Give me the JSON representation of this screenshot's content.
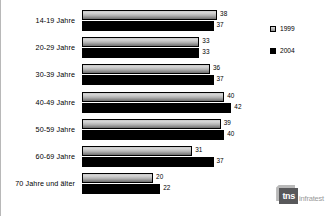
{
  "chart_data": {
    "type": "bar",
    "orientation": "horizontal",
    "title": "",
    "xlabel": "",
    "ylabel": "",
    "grid": false,
    "xlim": [
      0,
      45
    ],
    "legend_position": "right-top",
    "categories": [
      "14-19 Jahre",
      "20-29 Jahre",
      "30-39 Jahre",
      "40-49 Jahre",
      "50-59 Jahre",
      "60-69 Jahre",
      "70 Jahre und älter"
    ],
    "series": [
      {
        "name": "1999",
        "values": [
          38,
          33,
          36,
          40,
          39,
          31,
          20
        ]
      },
      {
        "name": "2004",
        "values": [
          37,
          33,
          37,
          42,
          40,
          37,
          22
        ]
      }
    ]
  },
  "legend": {
    "items": [
      {
        "label": "1999",
        "swatch": "gradient-gray"
      },
      {
        "label": "2004",
        "swatch": "solid-black"
      }
    ]
  },
  "logo": {
    "mark": "tns",
    "word": "infratest"
  },
  "colors": {
    "series_1999": "#b4b4b4",
    "series_2004": "#000000",
    "text": "#000000",
    "background": "#ffffff",
    "logo_mark": "#58585a",
    "logo_word": "#9a9a9a"
  }
}
